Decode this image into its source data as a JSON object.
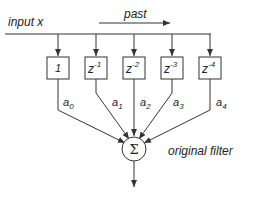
{
  "diagram": {
    "input_label": "input  x",
    "past_label": "past",
    "sum_symbol": "Σ",
    "filter_label": "original  filter",
    "taps": [
      {
        "delay_base": "1",
        "delay_exp": "",
        "coef_base": "a",
        "coef_sub": "0"
      },
      {
        "delay_base": "z",
        "delay_exp": "-1",
        "coef_base": "a",
        "coef_sub": "1"
      },
      {
        "delay_base": "z",
        "delay_exp": "-2",
        "coef_base": "a",
        "coef_sub": "2"
      },
      {
        "delay_base": "z",
        "delay_exp": "-3",
        "coef_base": "a",
        "coef_sub": "3"
      },
      {
        "delay_base": "z",
        "delay_exp": "-4",
        "coef_base": "a",
        "coef_sub": "4"
      }
    ],
    "colors": {
      "stroke": "#333333",
      "background": "#ffffff"
    }
  }
}
